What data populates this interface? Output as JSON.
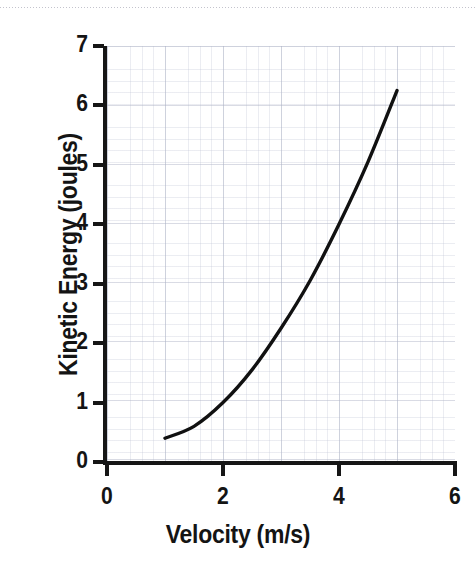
{
  "chart_data": {
    "type": "line",
    "title": "",
    "xlabel": "Velocity (m/s)",
    "ylabel": "Kinetic Energy (joules)",
    "xlim": [
      0,
      6
    ],
    "ylim": [
      0,
      7
    ],
    "x_ticks": [
      "0",
      "2",
      "4",
      "6"
    ],
    "x_tick_values": [
      0,
      2,
      4,
      6
    ],
    "y_ticks": [
      "0",
      "1",
      "2",
      "3",
      "4",
      "5",
      "6",
      "7"
    ],
    "y_tick_values": [
      0,
      1,
      2,
      3,
      4,
      5,
      6,
      7
    ],
    "grid": "graph-paper minor and major grid",
    "legend": "none",
    "relation": "KE = 0.25 * v^2",
    "line_color": "#111111",
    "series": [
      {
        "name": "Kinetic Energy",
        "x": [
          1.0,
          1.5,
          2.0,
          2.5,
          3.0,
          3.5,
          4.0,
          4.5,
          5.0
        ],
        "values": [
          0.4,
          0.6,
          1.0,
          1.55,
          2.25,
          3.05,
          4.0,
          5.05,
          6.25
        ]
      }
    ]
  },
  "axes": {
    "y_title": "Kinetic Energy (joules)",
    "x_title": "Velocity (m/s)"
  }
}
